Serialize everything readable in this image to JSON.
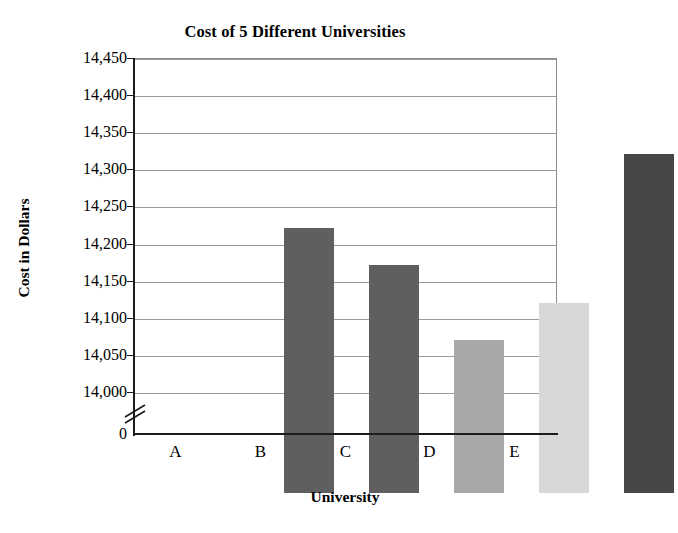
{
  "chart_data": {
    "type": "bar",
    "title": "Cost of 5 Different Universities",
    "xlabel": "University",
    "ylabel": "Cost in Dollars",
    "categories": [
      "A",
      "B",
      "C",
      "D",
      "E"
    ],
    "values": [
      14300,
      14250,
      14150,
      14200,
      14400
    ],
    "value_labels": [
      "14,300",
      "14,250",
      "14,150",
      "14,200",
      "14,400"
    ],
    "series": [
      {
        "name": "Cost in Dollars",
        "values": [
          14300,
          14250,
          14150,
          14200,
          14400
        ]
      }
    ],
    "ylim": [
      14000,
      14450
    ],
    "y_axis_has_break": true,
    "y_break_from": 0,
    "y_break_to": 14000,
    "yticks": [
      0,
      14000,
      14050,
      14100,
      14150,
      14200,
      14250,
      14300,
      14350,
      14400,
      14450
    ],
    "ytick_labels": [
      "0",
      "14,000",
      "14,050",
      "14,100",
      "14,150",
      "14,200",
      "14,250",
      "14,300",
      "14,350",
      "14,400",
      "14,450"
    ],
    "xtick_labels": [
      "A",
      "B",
      "C",
      "D",
      "E"
    ],
    "grid": "horizontal",
    "legend": "none",
    "bar_colors": [
      "#5f5f5f",
      "#5f5f5f",
      "#a8a8a8",
      "#d8d8d8",
      "#474747"
    ],
    "colors": {
      "axis": "#1c1c1c",
      "gridline": "#9a9a9a",
      "frame": "#8c8c8c",
      "background": "#ffffff",
      "text": "#000000"
    }
  }
}
